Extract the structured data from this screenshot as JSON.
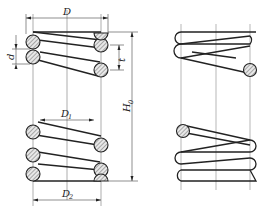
{
  "diagram": {
    "views": [
      "section-view",
      "outside-view"
    ],
    "labels": {
      "outer_diameter": "D",
      "wire_diameter": "d",
      "pitch": "t",
      "free_height": "H",
      "free_height_sub": "0",
      "mean_diameter": "D",
      "mean_diameter_sub": "1",
      "inner_diameter": "D",
      "inner_diameter_sub": "2"
    },
    "colors": {
      "line": "#222222",
      "centerline": "#888888",
      "hatch": "#444444",
      "section_fill": "#e8e8e8"
    }
  }
}
